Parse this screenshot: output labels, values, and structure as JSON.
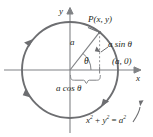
{
  "figure": {
    "type": "unit-circle-trigonometry-diagram",
    "colors": {
      "curve": "#6d6e71",
      "axis": "#808285",
      "text": "#231f20",
      "dashed": "#939598",
      "radius": "#808285",
      "background": "#ffffff"
    },
    "labels": {
      "y_axis": "y",
      "x_axis": "x",
      "point": "P(x, y)",
      "radius": "a",
      "angle": "θ",
      "opposite": "a sin θ",
      "adjacent": "a cos θ",
      "x_intercept": "(a, 0)",
      "equation_lhs": "x",
      "equation": "x² + y² = a²"
    },
    "equation_parts": {
      "x": "x",
      "x_exp": "2",
      "plus": " + ",
      "y": "y",
      "y_exp": "2",
      "eq": " = ",
      "a": "a",
      "a_exp": "2"
    },
    "geometry": {
      "center_x": 70,
      "center_y": 70,
      "radius_px": 48,
      "point_angle_deg": 52,
      "point_x": 99.6,
      "point_y": 32.2,
      "direction": "counterclockwise",
      "arrow_positions_deg": [
        140,
        215,
        310
      ]
    }
  }
}
